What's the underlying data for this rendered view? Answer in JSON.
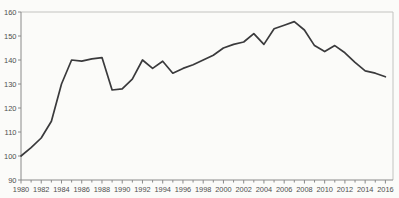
{
  "chart_data": {
    "type": "line",
    "title": "",
    "xlabel": "",
    "ylabel": "",
    "x": [
      1980,
      1981,
      1982,
      1983,
      1984,
      1985,
      1986,
      1987,
      1988,
      1989,
      1990,
      1991,
      1992,
      1993,
      1994,
      1995,
      1996,
      1997,
      1998,
      1999,
      2000,
      2001,
      2002,
      2003,
      2004,
      2005,
      2006,
      2007,
      2008,
      2009,
      2010,
      2011,
      2012,
      2013,
      2014,
      2015,
      2016
    ],
    "series": [
      {
        "name": "index-line",
        "values": [
          100,
          103.5,
          107.5,
          114.5,
          130,
          140,
          139.5,
          140.5,
          141,
          127.5,
          128,
          132,
          140,
          136.5,
          139.5,
          134.5,
          136.5,
          138,
          140,
          142,
          145,
          146.5,
          147.5,
          151,
          146.5,
          153,
          154.5,
          156,
          152.5,
          146,
          143.5,
          146,
          143,
          139,
          135.5,
          134.5,
          133
        ]
      }
    ],
    "xlim": [
      1980,
      2016
    ],
    "ylim": [
      90,
      160
    ],
    "yticks": [
      90,
      100,
      110,
      120,
      130,
      140,
      150,
      160
    ],
    "xtick_labels": [
      "1980",
      "1982",
      "1984",
      "1986",
      "1988",
      "1990",
      "1992",
      "1994",
      "1996",
      "1998",
      "2000",
      "2002",
      "2004",
      "2006",
      "2008",
      "2010",
      "2012",
      "2014",
      "2016"
    ],
    "xtick_label_step": 2,
    "minor_xticks_every_year": true,
    "grid": false,
    "legend": "none",
    "colors": {
      "line": "#3a3a3c",
      "axis": "#8a8a8a",
      "frame": "#c3c3c0",
      "tick": "#8a8a8a",
      "label": "#4f4f4f",
      "background": "#fbfbf9"
    }
  }
}
